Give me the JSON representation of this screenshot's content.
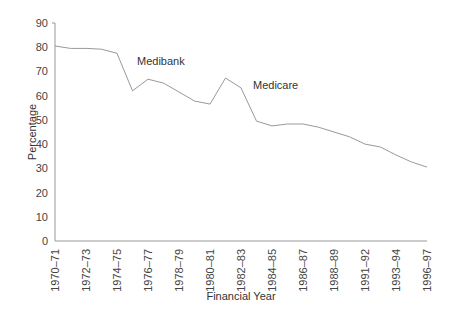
{
  "chart_data": {
    "type": "line",
    "title": "",
    "xlabel": "Financial Year",
    "ylabel": "Percentage",
    "ylim": [
      0,
      90
    ],
    "yticks": [
      0,
      10,
      20,
      30,
      40,
      50,
      60,
      70,
      80,
      90
    ],
    "grid": false,
    "legend": null,
    "x_tick_labels": [
      "1970–71",
      "1972–73",
      "1974–75",
      "1976–77",
      "1978–79",
      "1980–81",
      "1982–83",
      "1984–85",
      "1986–87",
      "1988–89",
      "1991–92",
      "1993–94",
      "1996–97"
    ],
    "series": [
      {
        "name": "Percentage",
        "color": "#999999",
        "values": [
          80.5,
          79.5,
          79.5,
          79.2,
          77.5,
          62.0,
          66.8,
          65.2,
          61.5,
          57.8,
          56.5,
          67.3,
          63.2,
          49.5,
          47.5,
          48.3,
          48.3,
          47.0,
          45.0,
          43.0,
          40.0,
          38.8,
          35.5,
          32.6,
          30.5
        ]
      }
    ],
    "annotations": [
      {
        "text": "Medibank",
        "near_index": 6
      },
      {
        "text": "Medicare",
        "near_index": 13
      }
    ]
  }
}
